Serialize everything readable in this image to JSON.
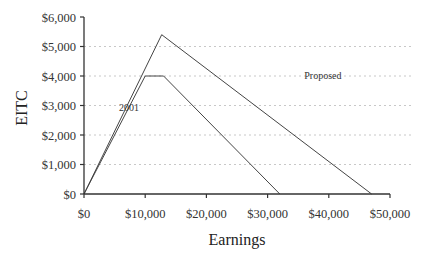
{
  "chart_data": {
    "type": "line",
    "title": "",
    "xlabel": "Earnings",
    "ylabel": "EITC",
    "xlim": [
      0,
      50000
    ],
    "ylim": [
      0,
      6000
    ],
    "x_ticks": [
      "$0",
      "$10,000",
      "$20,000",
      "$30,000",
      "$40,000",
      "$50,000"
    ],
    "y_ticks": [
      "$0",
      "$1,000",
      "$2,000",
      "$3,000",
      "$4,000",
      "$5,000",
      "$6,000"
    ],
    "grid": "horizontal dotted",
    "legend": "inline labels",
    "series": [
      {
        "name": "2001",
        "points": [
          [
            0,
            0
          ],
          [
            10000,
            4000
          ],
          [
            13000,
            4000
          ],
          [
            32000,
            0
          ]
        ]
      },
      {
        "name": "Proposed",
        "points": [
          [
            0,
            0
          ],
          [
            12700,
            5400
          ],
          [
            47000,
            0
          ]
        ]
      }
    ],
    "annotations": [
      {
        "text": "2001",
        "x": 5700,
        "y": 2800
      },
      {
        "text": "Proposed",
        "x": 36000,
        "y": 3900
      }
    ]
  }
}
